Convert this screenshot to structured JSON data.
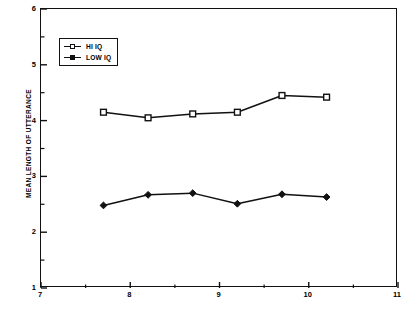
{
  "chart_data": {
    "type": "line",
    "title": "",
    "xlabel": "",
    "ylabel": "MEAN LENGTH OF UTTERANCE",
    "xlim": [
      7,
      11
    ],
    "ylim": [
      1,
      6
    ],
    "xticks": [
      "7",
      "8",
      "9",
      "10",
      "11"
    ],
    "xtick_values": [
      7,
      8,
      9,
      10,
      11
    ],
    "yticks": [
      "1",
      "2",
      "3",
      "4",
      "5",
      "6"
    ],
    "ytick_values": [
      1,
      2,
      3,
      4,
      5,
      6
    ],
    "x_minor_ticks": [
      7.5,
      8.5,
      9.5,
      10.5
    ],
    "y_minor_ticks": [
      1.5,
      2.5,
      3.5,
      4.5,
      5.5
    ],
    "grid": false,
    "legend_position": "upper-left",
    "x": [
      7.7,
      8.2,
      8.7,
      9.2,
      9.7,
      10.2
    ],
    "series": [
      {
        "name": "HI IQ",
        "marker": "open-square",
        "color": "#111111",
        "values": [
          4.15,
          4.05,
          4.12,
          4.15,
          4.45,
          4.42
        ]
      },
      {
        "name": "LOW IQ",
        "marker": "filled-diamond",
        "color": "#111111",
        "values": [
          2.48,
          2.67,
          2.7,
          2.51,
          2.68,
          2.63
        ]
      }
    ]
  },
  "legend": {
    "items": [
      {
        "label": "HI IQ"
      },
      {
        "label": "LOW IQ"
      }
    ]
  },
  "colors": {
    "axis": "#111111",
    "background": "#ffffff",
    "ink": "#000000"
  }
}
